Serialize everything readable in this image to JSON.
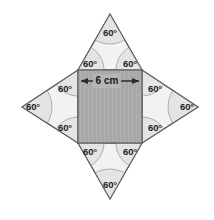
{
  "figure": {
    "background_color": "#ffffff",
    "outline_color": "#5f5f5f",
    "square": {
      "name": "center-square",
      "fill_color": "#a8a8a8",
      "side_length_text": "6 cm",
      "side_value": 6,
      "units": "cm"
    },
    "triangles": {
      "fill_color": "#f2f2f2",
      "count": 4,
      "names": [
        "top",
        "right",
        "bottom",
        "left"
      ]
    },
    "arc_marker": {
      "fill_color": "#e2e2e2",
      "stroke_color": "#9a9a9a"
    },
    "dimension": {
      "label": "6 cm",
      "arrow_color": "#2a2a2a"
    },
    "angles": [
      {
        "id": "top-apex",
        "label": "60°",
        "x": 110,
        "y": 33
      },
      {
        "id": "top-base-left",
        "label": "60°",
        "x": 90,
        "y": 64
      },
      {
        "id": "top-base-right",
        "label": "60°",
        "x": 130,
        "y": 64
      },
      {
        "id": "right-apex",
        "label": "60°",
        "x": 187,
        "y": 107
      },
      {
        "id": "right-base-top",
        "label": "60°",
        "x": 155,
        "y": 89
      },
      {
        "id": "right-base-bottom",
        "label": "60°",
        "x": 155,
        "y": 128
      },
      {
        "id": "bottom-apex",
        "label": "60°",
        "x": 110,
        "y": 185
      },
      {
        "id": "bottom-base-left",
        "label": "60°",
        "x": 90,
        "y": 152
      },
      {
        "id": "bottom-base-right",
        "label": "60°",
        "x": 130,
        "y": 152
      },
      {
        "id": "left-apex",
        "label": "60°",
        "x": 33,
        "y": 107
      },
      {
        "id": "left-base-top",
        "label": "60°",
        "x": 65,
        "y": 89
      },
      {
        "id": "left-base-bottom",
        "label": "60°",
        "x": 65,
        "y": 128
      }
    ]
  }
}
